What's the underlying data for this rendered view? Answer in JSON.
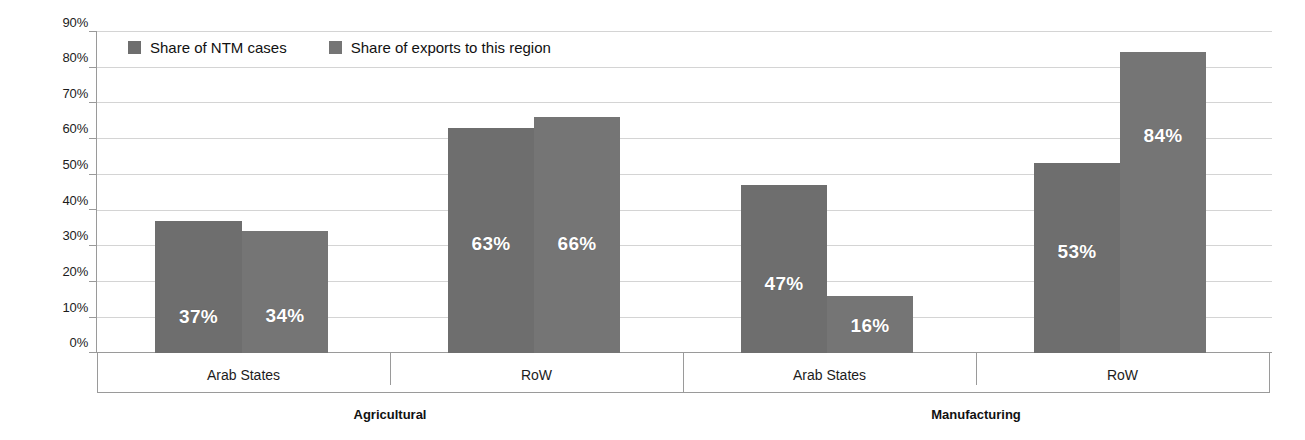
{
  "chart_data": {
    "type": "bar",
    "title": "",
    "subtitle": "",
    "xlabel": "",
    "ylabel": "",
    "ylim": [
      0,
      90
    ],
    "grid": true,
    "legend_position": "top-left",
    "y_ticks": [
      "0%",
      "10%",
      "20%",
      "30%",
      "40%",
      "50%",
      "60%",
      "70%",
      "80%",
      "90%"
    ],
    "y_tick_values": [
      0,
      10,
      20,
      30,
      40,
      50,
      60,
      70,
      80,
      90
    ],
    "categories": [
      "Arab States",
      "RoW",
      "Arab States",
      "RoW"
    ],
    "groups": [
      {
        "label": "Agricultural",
        "categories": [
          "Arab States",
          "RoW"
        ]
      },
      {
        "label": "Manufacturing",
        "categories": [
          "Arab States",
          "RoW"
        ]
      }
    ],
    "series": [
      {
        "name": "Share of NTM cases",
        "color": "#6e6e6e",
        "values": [
          37,
          63,
          47,
          53
        ]
      },
      {
        "name": "Share of exports to this region",
        "color": "#757575",
        "values": [
          34,
          66,
          16,
          84
        ]
      }
    ],
    "bars": [
      {
        "group": "Agricultural",
        "category": "Arab States",
        "series": "Share of NTM cases",
        "value": 37,
        "label": "37%"
      },
      {
        "group": "Agricultural",
        "category": "Arab States",
        "series": "Share of exports to this region",
        "value": 34,
        "label": "34%"
      },
      {
        "group": "Agricultural",
        "category": "RoW",
        "series": "Share of NTM cases",
        "value": 63,
        "label": "63%"
      },
      {
        "group": "Agricultural",
        "category": "RoW",
        "series": "Share of exports to this region",
        "value": 66,
        "label": "66%"
      },
      {
        "group": "Manufacturing",
        "category": "Arab States",
        "series": "Share of NTM cases",
        "value": 47,
        "label": "47%"
      },
      {
        "group": "Manufacturing",
        "category": "Arab States",
        "series": "Share of exports to this region",
        "value": 16,
        "label": "16%"
      },
      {
        "group": "Manufacturing",
        "category": "RoW",
        "series": "Share of NTM cases",
        "value": 53,
        "label": "53%"
      },
      {
        "group": "Manufacturing",
        "category": "RoW",
        "series": "Share of exports to this region",
        "value": 84,
        "label": "84%"
      }
    ]
  },
  "legend": {
    "items": [
      {
        "label": "Share of NTM cases",
        "color": "#6e6e6e"
      },
      {
        "label": "Share of exports to this region",
        "color": "#757575"
      }
    ]
  },
  "axis": {
    "y_ticks": [
      "90%",
      "80%",
      "70%",
      "60%",
      "50%",
      "40%",
      "30%",
      "20%",
      "10%",
      "0%"
    ]
  },
  "colors": {
    "bar_series_1": "#6e6e6e",
    "bar_series_2": "#757575",
    "gridline": "#d4d4d4",
    "axis": "#9a9a9a",
    "value_text": "#ffffff",
    "background": "#ffffff"
  }
}
